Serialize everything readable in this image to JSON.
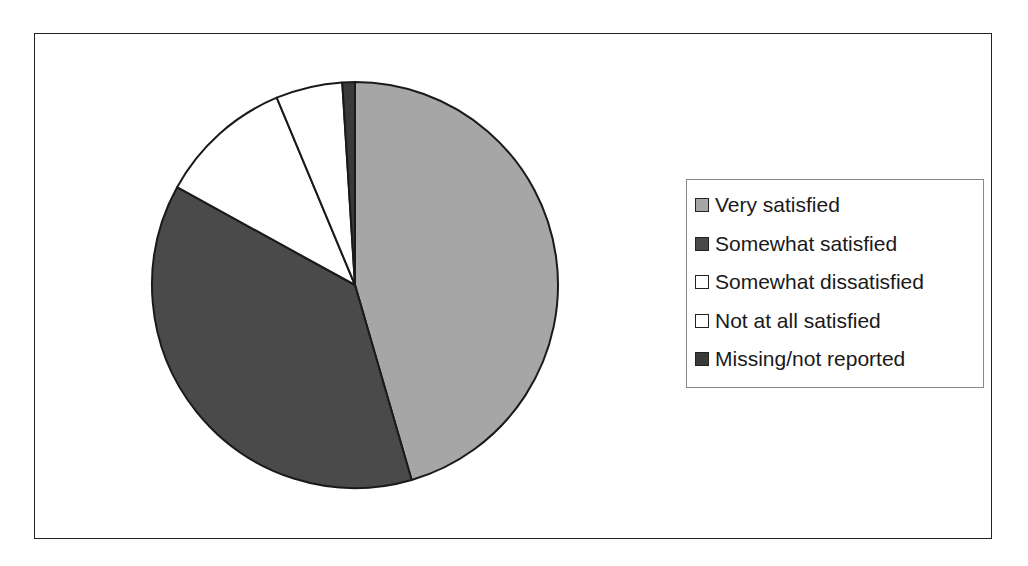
{
  "chart_data": {
    "type": "pie",
    "title": "",
    "categories": [
      "Very satisfied",
      "Somewhat satisfied",
      "Somewhat dissatisfied",
      "Not at all satisfied",
      "Missing/not reported"
    ],
    "values": [
      45.5,
      37.5,
      10.7,
      5.3,
      1.0
    ],
    "unit": "percent (estimated)",
    "colors": [
      "#a6a6a6",
      "#4a4a4a",
      "#ffffff",
      "#ffffff",
      "#3a3a3a"
    ],
    "start_angle_deg": 0,
    "direction": "clockwise",
    "legend_position": "right"
  },
  "legend": {
    "items": [
      {
        "label": "Very satisfied",
        "color": "#a6a6a6"
      },
      {
        "label": "Somewhat satisfied",
        "color": "#4a4a4a"
      },
      {
        "label": "Somewhat dissatisfied",
        "color": "#ffffff"
      },
      {
        "label": "Not at all satisfied",
        "color": "#ffffff"
      },
      {
        "label": "Missing/not reported",
        "color": "#3a3a3a"
      }
    ]
  }
}
